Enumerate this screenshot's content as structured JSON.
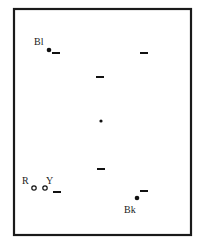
{
  "diagram": {
    "type": "table-layout",
    "frame_color": "#1a1a1a",
    "balls": [
      {
        "id": "blue",
        "label": "Bl",
        "style": "filled"
      },
      {
        "id": "red",
        "label": "R",
        "style": "ring"
      },
      {
        "id": "yellow",
        "label": "Y",
        "style": "ring"
      },
      {
        "id": "black",
        "label": "Bk",
        "style": "filled"
      }
    ],
    "markers": [
      {
        "id": "dash-top-left"
      },
      {
        "id": "dash-top-right"
      },
      {
        "id": "dash-upper-center"
      },
      {
        "id": "center-spot"
      },
      {
        "id": "dash-lower-center"
      },
      {
        "id": "dash-bottom-left"
      },
      {
        "id": "dash-bottom-right"
      }
    ]
  }
}
